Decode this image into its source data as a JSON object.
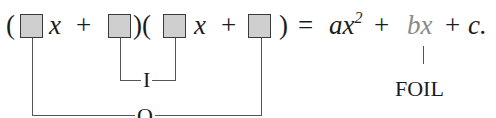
{
  "equation": {
    "open_paren_1": "(",
    "var_1": "x",
    "plus_1": "+",
    "close_open_paren": ")(",
    "var_2": "x",
    "plus_2": "+",
    "close_paren_2": ")",
    "equals": "=",
    "term_a": "ax",
    "exponent": "2",
    "plus_3": "+",
    "term_b": "bx",
    "plus_4": "+",
    "term_c": "c."
  },
  "labels": {
    "inner": "I",
    "outer": "O",
    "foil": "FOIL"
  },
  "colors": {
    "box_fill": "#cfcfcf",
    "box_border": "#3a3a3a",
    "highlight_term": "#8a8a8a",
    "line": "#555555"
  }
}
